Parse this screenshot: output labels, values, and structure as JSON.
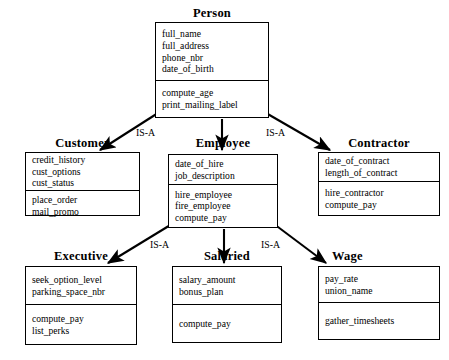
{
  "diagram": {
    "kind": "uml-class-inheritance-diagram",
    "relationship_label": "IS-A",
    "line_color": "#000000",
    "box_fill": "#ffffff",
    "text_color": "#000000"
  },
  "classes": {
    "person": {
      "name": "Person",
      "attributes": [
        "full_name",
        "full_address",
        "phone_nbr",
        "date_of_birth"
      ],
      "methods": [
        "compute_age",
        "print_mailing_label"
      ]
    },
    "customer": {
      "name": "Customer",
      "attributes": [
        "credit_history",
        "cust_options",
        "cust_status"
      ],
      "methods": [
        "place_order",
        "mail_promo"
      ]
    },
    "employee": {
      "name": "Employee",
      "attributes": [
        "date_of_hire",
        "job_description"
      ],
      "methods": [
        "hire_employee",
        "fire_employee",
        "compute_pay"
      ]
    },
    "contractor": {
      "name": "Contractor",
      "attributes": [
        "date_of_contract",
        "length_of_contract"
      ],
      "methods": [
        "hire_contractor",
        "compute_pay"
      ]
    },
    "executive": {
      "name": "Executive",
      "attributes": [
        "seek_option_level",
        "parking_space_nbr"
      ],
      "methods": [
        "compute_pay",
        "list_perks"
      ]
    },
    "salaried": {
      "name": "Salaried",
      "attributes": [
        "salary_amount",
        "bonus_plan"
      ],
      "methods": [
        "compute_pay"
      ]
    },
    "wage": {
      "name": "Wage",
      "attributes": [
        "pay_rate",
        "union_name"
      ],
      "methods": [
        "gather_timesheets"
      ]
    }
  },
  "relationships": [
    {
      "id": "person-customer",
      "from": "Person",
      "to": "Customer",
      "label": ""
    },
    {
      "id": "person-employee",
      "from": "Person",
      "to": "Employee",
      "label": "IS-A"
    },
    {
      "id": "person-contractor",
      "from": "Person",
      "to": "Contractor",
      "label": "IS-A"
    },
    {
      "id": "employee-executive",
      "from": "Employee",
      "to": "Executive",
      "label": ""
    },
    {
      "id": "employee-salaried",
      "from": "Employee",
      "to": "Salaried",
      "label": "IS-A"
    },
    {
      "id": "employee-wage",
      "from": "Employee",
      "to": "Wage",
      "label": "IS-A"
    }
  ],
  "labels": {
    "isa_person_left": "IS-A",
    "isa_person_right": "IS-A",
    "isa_employee_left": "IS-A",
    "isa_employee_right": "IS-A"
  }
}
